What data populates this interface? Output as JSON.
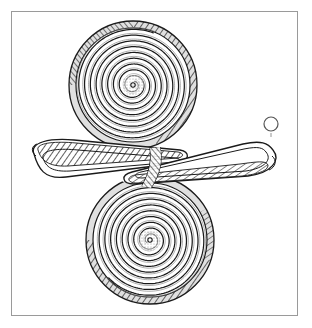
{
  "figure": {
    "object_type": "archaeological line drawing",
    "technique": "ink line drawing with cross-hatched shading",
    "canvas": {
      "width": 312,
      "height": 328,
      "background_color": "#ffffff"
    },
    "frame": {
      "name": "plate-border",
      "x": 11,
      "y": 11,
      "width": 287,
      "height": 305,
      "stroke_color": "#9a9a9a",
      "stroke_width": 1,
      "fill_color": "#ffffff"
    },
    "ink_color": "#1a1a1a",
    "hatch_color": "#333333",
    "parts": [
      {
        "name": "upper-spiral-disc",
        "shape": "flat wire spiral disc",
        "center_x": 133,
        "center_y": 85,
        "outer_radius": 63,
        "inner_radius": 4,
        "turns": 9,
        "wire_width": 3.2,
        "rim_shaded": true
      },
      {
        "name": "lower-spiral-disc",
        "shape": "flat wire spiral disc",
        "center_x": 150,
        "center_y": 240,
        "outer_radius": 63,
        "inner_radius": 4,
        "turns": 9,
        "wire_width": 3.2,
        "rim_shaded": true
      },
      {
        "name": "connecting-bow",
        "shape": "figure-eight looped bow of round wire",
        "left_tip_x": 30,
        "right_tip_x": 274,
        "band_top_y": 143,
        "band_bottom_y": 182,
        "wire_width": 8
      },
      {
        "name": "wire-cross-section",
        "shape": "circle",
        "center_x": 271,
        "center_y": 124,
        "radius": 7,
        "stroke_color": "#555555",
        "fill_color": "#ffffff"
      }
    ],
    "labels": {
      "scale_note": "",
      "catalogue_number": "",
      "caption": ""
    }
  }
}
